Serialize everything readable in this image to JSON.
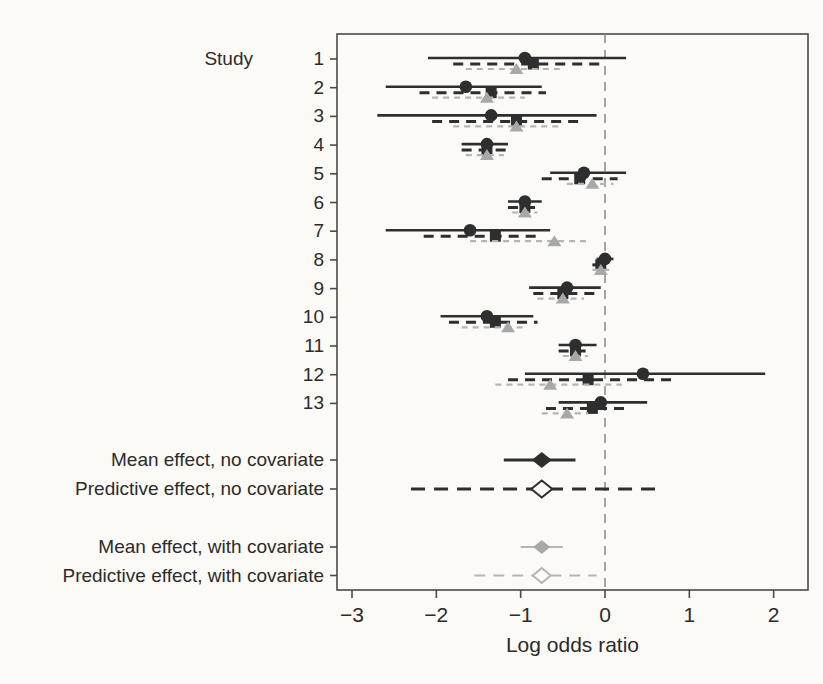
{
  "figure": {
    "background": "#fbfaf7",
    "frame_color": "#4a4a4a",
    "dark_color": "#2e2e2e",
    "gray_color": "#a8a8a8",
    "gray_line_color": "#b5b5b5",
    "zero_line_color": "#8f8f8f",
    "text_color": "#2b2b2b"
  },
  "chart_data": {
    "type": "forest",
    "title": "",
    "xlabel": "Log odds ratio",
    "column_header": "Study",
    "xlim": [
      -3.18,
      2.41
    ],
    "x_ticks": [
      {
        "value": -3,
        "label": "−3"
      },
      {
        "value": -2,
        "label": "−2"
      },
      {
        "value": -1,
        "label": "−1"
      },
      {
        "value": 0,
        "label": "0"
      },
      {
        "value": 1,
        "label": "1"
      },
      {
        "value": 2,
        "label": "2"
      }
    ],
    "zero_reference_line": {
      "x": 0,
      "style": "dashed"
    },
    "series_styles": [
      {
        "name": "observed-estimate",
        "marker": "circle",
        "line": "solid",
        "tone": "dark"
      },
      {
        "name": "shrunken-estimate-no-covariate",
        "marker": "square",
        "line": "dashed",
        "tone": "dark"
      },
      {
        "name": "shrunken-estimate-with-covariate",
        "marker": "triangle",
        "line": "dashdot",
        "tone": "gray"
      }
    ],
    "studies": [
      {
        "label": "1",
        "rows": [
          {
            "est": -0.95,
            "lo": -2.1,
            "hi": 0.25
          },
          {
            "est": -0.85,
            "lo": -1.8,
            "hi": -0.05
          },
          {
            "est": -1.05,
            "lo": -1.65,
            "hi": -0.5
          }
        ]
      },
      {
        "label": "2",
        "rows": [
          {
            "est": -1.65,
            "lo": -2.6,
            "hi": -0.75
          },
          {
            "est": -1.35,
            "lo": -2.2,
            "hi": -0.7
          },
          {
            "est": -1.4,
            "lo": -2.05,
            "hi": -0.95
          }
        ]
      },
      {
        "label": "3",
        "rows": [
          {
            "est": -1.35,
            "lo": -2.7,
            "hi": -0.1
          },
          {
            "est": -1.05,
            "lo": -2.05,
            "hi": -0.25
          },
          {
            "est": -1.05,
            "lo": -1.8,
            "hi": -0.55
          }
        ]
      },
      {
        "label": "4",
        "rows": [
          {
            "est": -1.4,
            "lo": -1.7,
            "hi": -1.15
          },
          {
            "est": -1.4,
            "lo": -1.7,
            "hi": -1.15
          },
          {
            "est": -1.4,
            "lo": -1.65,
            "hi": -1.2
          }
        ]
      },
      {
        "label": "5",
        "rows": [
          {
            "est": -0.25,
            "lo": -0.65,
            "hi": 0.25
          },
          {
            "est": -0.3,
            "lo": -0.75,
            "hi": 0.15
          },
          {
            "est": -0.15,
            "lo": -0.45,
            "hi": 0.1
          }
        ]
      },
      {
        "label": "6",
        "rows": [
          {
            "est": -0.95,
            "lo": -1.15,
            "hi": -0.75
          },
          {
            "est": -0.95,
            "lo": -1.15,
            "hi": -0.75
          },
          {
            "est": -0.95,
            "lo": -1.1,
            "hi": -0.8
          }
        ]
      },
      {
        "label": "7",
        "rows": [
          {
            "est": -1.6,
            "lo": -2.6,
            "hi": -0.65
          },
          {
            "est": -1.3,
            "lo": -2.15,
            "hi": -0.8
          },
          {
            "est": -0.6,
            "lo": -1.6,
            "hi": -0.2
          }
        ]
      },
      {
        "label": "8",
        "rows": [
          {
            "est": 0.0,
            "lo": -0.1,
            "hi": 0.1
          },
          {
            "est": -0.05,
            "lo": -0.15,
            "hi": 0.05
          },
          {
            "est": -0.05,
            "lo": -0.15,
            "hi": 0.05
          }
        ]
      },
      {
        "label": "9",
        "rows": [
          {
            "est": -0.45,
            "lo": -0.9,
            "hi": -0.05
          },
          {
            "est": -0.5,
            "lo": -0.85,
            "hi": -0.1
          },
          {
            "est": -0.5,
            "lo": -0.8,
            "hi": -0.25
          }
        ]
      },
      {
        "label": "10",
        "rows": [
          {
            "est": -1.4,
            "lo": -1.95,
            "hi": -0.85
          },
          {
            "est": -1.3,
            "lo": -1.85,
            "hi": -0.8
          },
          {
            "est": -1.15,
            "lo": -1.7,
            "hi": -0.95
          }
        ]
      },
      {
        "label": "11",
        "rows": [
          {
            "est": -0.35,
            "lo": -0.55,
            "hi": -0.1
          },
          {
            "est": -0.35,
            "lo": -0.55,
            "hi": -0.15
          },
          {
            "est": -0.35,
            "lo": -0.5,
            "hi": -0.2
          }
        ]
      },
      {
        "label": "12",
        "rows": [
          {
            "est": 0.45,
            "lo": -0.95,
            "hi": 1.9
          },
          {
            "est": -0.2,
            "lo": -1.15,
            "hi": 0.85
          },
          {
            "est": -0.65,
            "lo": -1.3,
            "hi": 0.2
          }
        ]
      },
      {
        "label": "13",
        "rows": [
          {
            "est": -0.05,
            "lo": -0.55,
            "hi": 0.5
          },
          {
            "est": -0.15,
            "lo": -0.7,
            "hi": 0.3
          },
          {
            "est": -0.45,
            "lo": -0.75,
            "hi": -0.2
          }
        ]
      }
    ],
    "summaries": [
      {
        "label": "Mean effect, no covariate",
        "marker": "diamond-filled",
        "line": "solid",
        "tone": "dark",
        "est": -0.75,
        "lo": -1.2,
        "hi": -0.35
      },
      {
        "label": "Predictive effect, no covariate",
        "marker": "diamond-open",
        "line": "dashed",
        "tone": "dark",
        "est": -0.75,
        "lo": -2.3,
        "hi": 0.7
      },
      {
        "label": "Mean effect, with covariate",
        "marker": "diamond-filled",
        "line": "solid",
        "tone": "gray",
        "est": -0.75,
        "lo": -1.0,
        "hi": -0.5
      },
      {
        "label": "Predictive effect, with covariate",
        "marker": "diamond-open",
        "line": "dashed",
        "tone": "gray",
        "est": -0.75,
        "lo": -1.55,
        "hi": -0.1
      }
    ]
  }
}
